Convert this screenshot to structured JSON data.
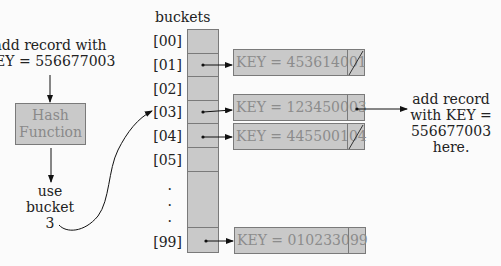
{
  "input_note": {
    "line1": "add record with",
    "line2": "KEY = 556677003"
  },
  "hash_function": {
    "line1": "Hash",
    "line2": "Function"
  },
  "hash_output_note": {
    "line1": "use",
    "line2": "bucket",
    "line3": "3"
  },
  "buckets": {
    "title": "buckets",
    "indices": [
      "[00]",
      "[01]",
      "[02]",
      "[03]",
      "[04]",
      "[05]",
      ".",
      ".",
      ".",
      "[99]"
    ],
    "records": [
      {
        "bucket": "[01]",
        "key_label": "KEY = 453614001",
        "next": "null"
      },
      {
        "bucket": "[03]",
        "key_label": "KEY = 123450003",
        "next": "pointer"
      },
      {
        "bucket": "[04]",
        "key_label": "KEY = 445500104",
        "next": "null"
      },
      {
        "bucket": "[99]",
        "key_label": "KEY = 010233099",
        "next": "empty"
      }
    ]
  },
  "insert_note": {
    "line1": "add record",
    "line2": "with KEY =",
    "line3": "556677003",
    "line4": "here."
  },
  "colors": {
    "box_fill": "#c9c9c9",
    "box_border": "#7a7a7a",
    "box_text": "#8c8c8c",
    "text": "#222222",
    "background": "#fbfbfb"
  }
}
